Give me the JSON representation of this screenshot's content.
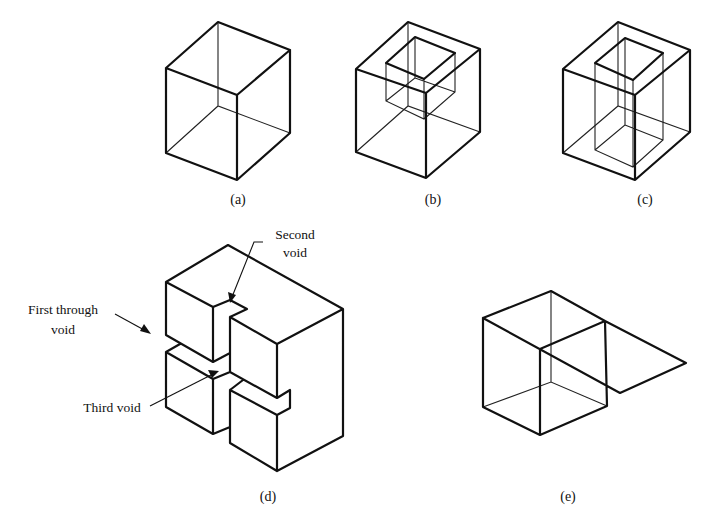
{
  "figure": {
    "panels": [
      {
        "id": "a",
        "label": "(a)",
        "description": "solid cube"
      },
      {
        "id": "b",
        "label": "(b)",
        "description": "cube with blind void"
      },
      {
        "id": "c",
        "label": "(c)",
        "description": "cube with through void"
      },
      {
        "id": "d",
        "label": "(d)",
        "description": "solid with multiple voids"
      },
      {
        "id": "e",
        "label": "(e)",
        "description": "cube with attached plane"
      }
    ],
    "annotations": {
      "first_void_line1": "First through",
      "first_void_line2": "void",
      "second_void_line1": "Second",
      "second_void_line2": "void",
      "third_void": "Third void"
    }
  }
}
